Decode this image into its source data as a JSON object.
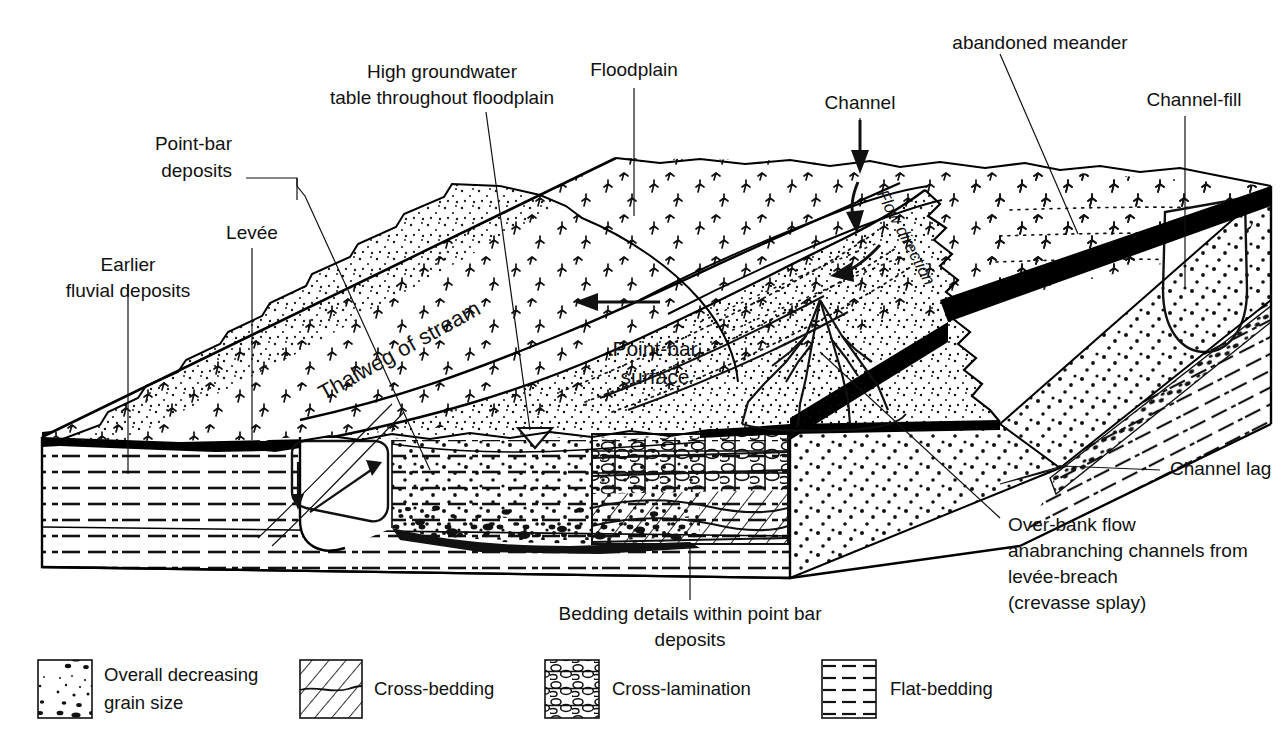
{
  "figure": {
    "background_color": "#ffffff",
    "ink_color": "#111111"
  },
  "labels": {
    "earlier_fluvial_deposits": "Earlier\nfluvial deposits",
    "earlier_fluvial_deposits_line1": "Earlier",
    "earlier_fluvial_deposits_line2": "fluvial deposits",
    "levee": "Levée",
    "point_bar_deposits_line1": "Point-bar",
    "point_bar_deposits_line2": "deposits",
    "high_groundwater_line1": "High groundwater",
    "high_groundwater_line2": "table throughout floodplain",
    "floodplain": "Floodplain",
    "channel": "Channel",
    "abandoned_meander": "abandoned meander",
    "channel_fill": "Channel-fill",
    "channel_lag": "Channel lag",
    "flow_direction": "Flow direction",
    "thalweg": "Thalweg of stream",
    "point_bar_surface_line1": "Point-bar",
    "point_bar_surface_line2": "surface",
    "overbank_line1": "Over-bank flow",
    "overbank_line2": "anabranching channels from",
    "overbank_line3": "levée-breach",
    "overbank_line4": "(crevasse splay)",
    "bedding_details_line1": "Bedding details within point bar",
    "bedding_details_line2": "deposits"
  },
  "legend": {
    "items": [
      {
        "key": "overall-decreasing-grain-size",
        "pattern": "grain-size-gradient",
        "label_line1": "Overall decreasing",
        "label_line2": "grain size"
      },
      {
        "key": "cross-bedding",
        "pattern": "cross-bedding",
        "label_line1": "Cross-bedding",
        "label_line2": ""
      },
      {
        "key": "cross-lamination",
        "pattern": "cross-lamination",
        "label_line1": "Cross-lamination",
        "label_line2": ""
      },
      {
        "key": "flat-bedding",
        "pattern": "flat-bedding",
        "label_line1": "Flat-bedding",
        "label_line2": ""
      }
    ]
  },
  "icons": {
    "water_table_symbol": "water-table-triangle-icon",
    "flow_arrow": "flow-direction-arrow-icon",
    "channel_arrow": "channel-down-arrow-icon",
    "upstream_arrow": "upstream-arrow-icon"
  },
  "colors": {
    "ink": "#111111",
    "channel_lag_fill": "#000000",
    "paper": "#ffffff"
  }
}
